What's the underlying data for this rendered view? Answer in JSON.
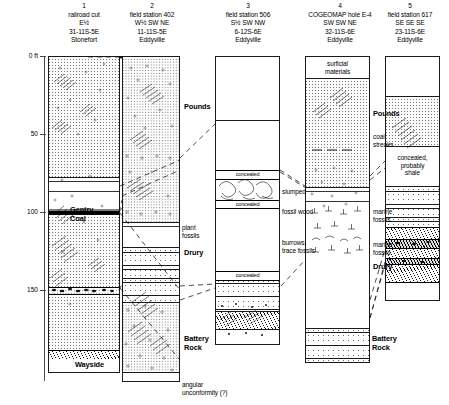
{
  "figure": {
    "type": "stratigraphic-correlation-diagram",
    "units": "ft"
  },
  "depth_axis": {
    "label_unit": "0 ft",
    "ticks": [
      "0 ft",
      "50",
      "100",
      "150"
    ],
    "tick_values": [
      0,
      50,
      100,
      150
    ]
  },
  "columns": [
    {
      "number": "1",
      "name": "railroad cut",
      "location_lines": [
        "E½",
        "31-11S-5E"
      ],
      "quadrangle": "Stonefort"
    },
    {
      "number": "2",
      "name": "field station 402",
      "location_lines": [
        "W½ SW NE",
        "11-11S-5E"
      ],
      "quadrangle": "Eddyville"
    },
    {
      "number": "3",
      "name": "field station 506",
      "location_lines": [
        "S½ SW NW",
        "6-12S-6E"
      ],
      "quadrangle": "Eddyville"
    },
    {
      "number": "4",
      "name": "COGEOMAP hole E-4",
      "location_lines": [
        "SW SW NE",
        "32-11S-6E"
      ],
      "quadrangle": "Eddyville"
    },
    {
      "number": "5",
      "name": "field station 617",
      "location_lines": [
        "SE SE SE",
        "23-11S-6E"
      ],
      "quadrangle": "Eddyville"
    }
  ],
  "formation_labels": [
    {
      "text": "Pounds",
      "column_ref": "2"
    },
    {
      "text": "Drury",
      "column_ref": "2"
    },
    {
      "text": "Battery\nRock",
      "column_ref": "2"
    },
    {
      "text": "Pounds",
      "column_ref": "4"
    },
    {
      "text": "Drury",
      "column_ref": "4"
    },
    {
      "text": "Battery\nRock",
      "column_ref": "4"
    }
  ],
  "bed_labels": [
    {
      "text": "Gentry\nCoal"
    },
    {
      "text": "Wayside"
    }
  ],
  "annotations": {
    "col1": [],
    "col2": [
      {
        "text": "Pounds",
        "style": "bold"
      },
      {
        "text": "plant\nfossils",
        "style": "plain"
      },
      {
        "text": "Drury",
        "style": "bold"
      },
      {
        "text": "Battery\nRock",
        "style": "bold"
      },
      {
        "text": "angular\nunconformity (?)",
        "style": "plain"
      }
    ],
    "col3": [
      {
        "text": "concealed",
        "style": "strip"
      },
      {
        "text": "slumped",
        "style": "plain"
      },
      {
        "text": "concealed",
        "style": "strip"
      },
      {
        "text": "fossil wood",
        "style": "plain"
      },
      {
        "text": "burrows,\ntrace fossils",
        "style": "plain"
      },
      {
        "text": "concealed",
        "style": "strip"
      }
    ],
    "col4": [
      {
        "text": "surficial\nmaterials",
        "style": "inbox"
      },
      {
        "text": "Pounds",
        "style": "bold"
      },
      {
        "text": "coal\nstreaks",
        "style": "plain"
      },
      {
        "text": "marine\nfossils",
        "style": "plain"
      },
      {
        "text": "marine\nfossils",
        "style": "plain"
      },
      {
        "text": "Drury",
        "style": "bold"
      },
      {
        "text": "Battery\nRock",
        "style": "bold"
      }
    ],
    "col5": [
      {
        "text": "concealed,\nprobably\nshale",
        "style": "inbox"
      }
    ]
  },
  "colors": {
    "ink": "#1a1a1a",
    "axis": "#4a4a4a",
    "coal": "#000000",
    "paper": "#ffffff"
  }
}
